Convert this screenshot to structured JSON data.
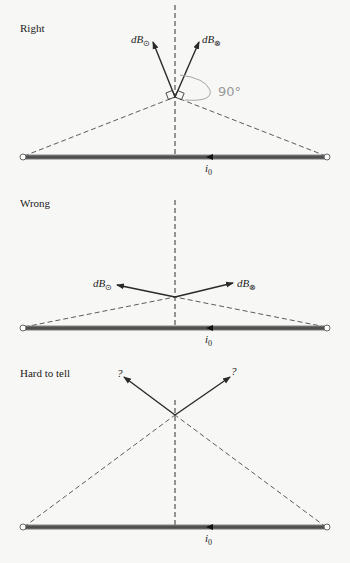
{
  "panels": [
    {
      "title": "Right",
      "left_vector_label": "dB",
      "left_vector_sub": "⊙",
      "right_vector_label": "dB",
      "right_vector_sub": "⊗",
      "current_label": "i",
      "current_sub": "0",
      "annotation": "90°"
    },
    {
      "title": "Wrong",
      "left_vector_label": "dB",
      "left_vector_sub": "⊙",
      "right_vector_label": "dB",
      "right_vector_sub": "⊗",
      "current_label": "i",
      "current_sub": "0"
    },
    {
      "title": "Hard to tell",
      "left_vector_label": "?",
      "right_vector_label": "?",
      "current_label": "i",
      "current_sub": "0"
    }
  ],
  "colors": {
    "wire": "#555555",
    "arrow": "#2a2a2a",
    "dash": "#333333",
    "annotation": "#9a9a9a"
  }
}
